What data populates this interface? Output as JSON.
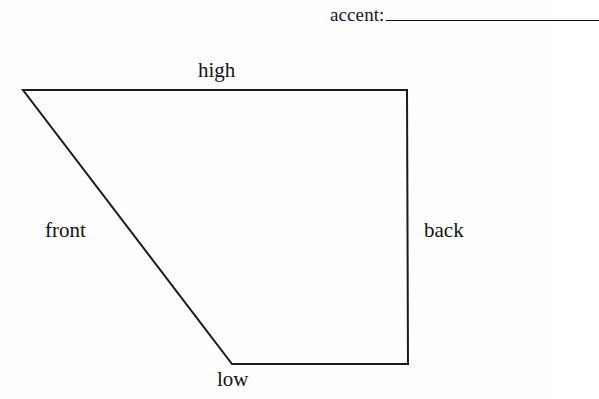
{
  "page": {
    "background_color": "#fefefe",
    "ink_color": "#111111",
    "width": 556,
    "height": 399
  },
  "prompt": {
    "label": "accent:",
    "answer_value": "",
    "blank_width_px": 213
  },
  "diagram": {
    "name": "quadrilateral-shape",
    "stroke_color": "#1b1b1b",
    "stroke_width": 2,
    "fill": "none",
    "points": "23,90 407,90 408,364 232,364",
    "vertices": [
      {
        "name": "top-left",
        "x": 23,
        "y": 90
      },
      {
        "name": "top-right",
        "x": 407,
        "y": 90
      },
      {
        "name": "bottom-right",
        "x": 408,
        "y": 364
      },
      {
        "name": "bottom-left",
        "x": 232,
        "y": 364
      }
    ],
    "edges": [
      {
        "name": "high",
        "label": "high",
        "from": "top-left",
        "to": "top-right"
      },
      {
        "name": "back",
        "label": "back",
        "from": "top-right",
        "to": "bottom-right"
      },
      {
        "name": "low",
        "label": "low",
        "from": "bottom-right",
        "to": "bottom-left"
      },
      {
        "name": "front",
        "label": "front",
        "from": "bottom-left",
        "to": "top-left"
      }
    ]
  },
  "labels": {
    "high": "high",
    "front": "front",
    "back": "back",
    "low": "low"
  }
}
